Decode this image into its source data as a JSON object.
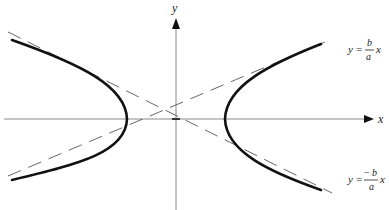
{
  "figure": {
    "type": "hyperbola-diagram",
    "axes": {
      "x_label": "x",
      "y_label": "y"
    },
    "asymptotes": [
      {
        "name": "positive-slope",
        "lhs": "y",
        "eq": "=",
        "sign": "",
        "numerator": "b",
        "denominator": "a",
        "var": "x"
      },
      {
        "name": "negative-slope",
        "lhs": "y",
        "eq": "=",
        "sign": "−",
        "numerator": "b",
        "denominator": "a",
        "var": "x"
      }
    ],
    "branches": [
      "left",
      "right"
    ],
    "colors": {
      "curve": "#111111",
      "axis": "#8a8a8a",
      "asymptote": "#555555"
    }
  }
}
